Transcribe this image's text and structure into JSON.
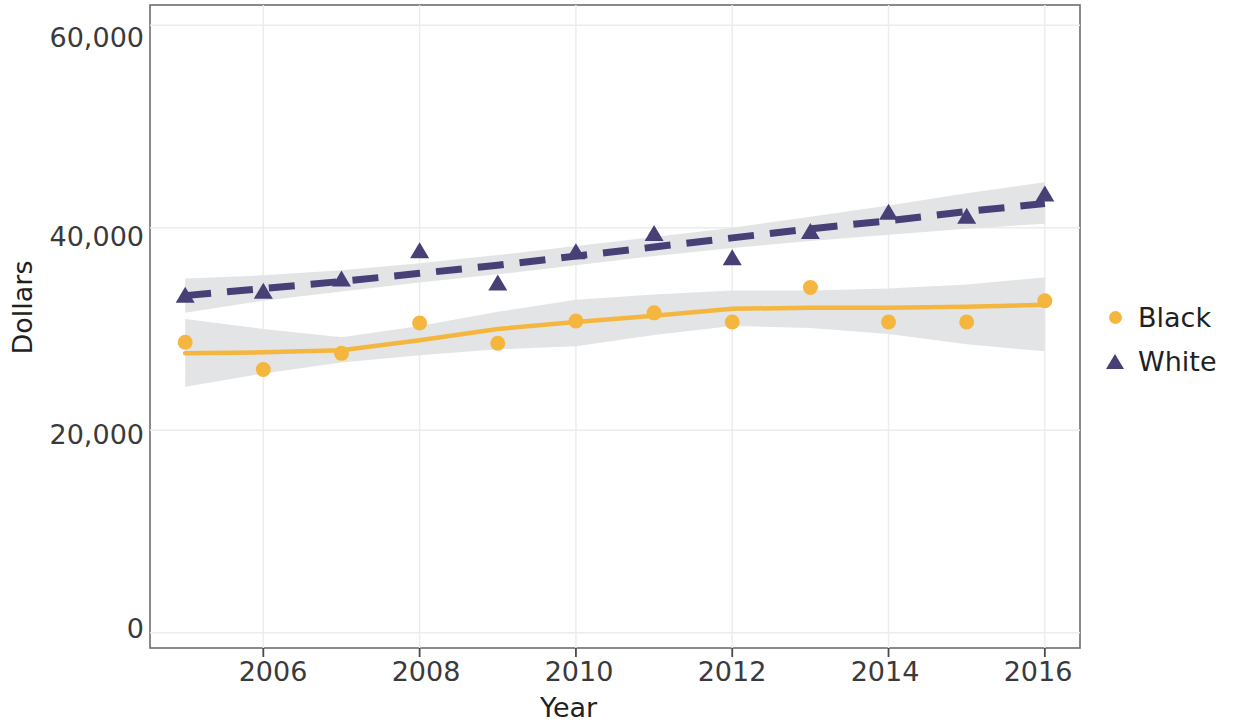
{
  "chart_data": {
    "type": "scatter",
    "title": "",
    "xlabel": "Year",
    "ylabel": "Dollars",
    "xlim": [
      2004.55,
      2016.45
    ],
    "ylim": [
      -1500,
      62000
    ],
    "xticks": [
      2006,
      2008,
      2010,
      2012,
      2014,
      2016
    ],
    "xtick_labels": [
      "2006",
      "2008",
      "2010",
      "2012",
      "2014",
      "2016"
    ],
    "yticks": [
      0,
      20000,
      40000,
      60000
    ],
    "ytick_labels": [
      "0",
      "20,000",
      "40,000",
      "60,000"
    ],
    "grid": true,
    "legend_position": "right",
    "x": [
      2005,
      2006,
      2007,
      2008,
      2009,
      2010,
      2011,
      2012,
      2013,
      2014,
      2015,
      2016
    ],
    "series": [
      {
        "name": "Black",
        "color": "#f5b63f",
        "marker": "circle",
        "line_style": "solid",
        "values": [
          28700,
          26000,
          27600,
          30600,
          28600,
          30800,
          31600,
          30700,
          34100,
          30700,
          30700,
          32800
        ],
        "trend": [
          27600,
          27700,
          27900,
          28900,
          30000,
          30700,
          31300,
          32000,
          32100,
          32100,
          32200,
          32400
        ],
        "band_lower": [
          24300,
          25600,
          26700,
          27400,
          28000,
          28300,
          29400,
          30300,
          30100,
          29500,
          28500,
          27800
        ],
        "band_upper": [
          31000,
          30000,
          29200,
          30300,
          31700,
          32900,
          33400,
          33800,
          33800,
          34000,
          34400,
          35100
        ]
      },
      {
        "name": "White",
        "color": "#464076",
        "marker": "triangle",
        "line_style": "dashed",
        "values": [
          33200,
          33600,
          34800,
          37600,
          34400,
          37500,
          39300,
          36900,
          39500,
          41400,
          41000,
          43200
        ],
        "trend": [
          33300,
          34000,
          34700,
          35500,
          36300,
          37200,
          38100,
          39000,
          39900,
          40700,
          41600,
          42400
        ],
        "band_lower": [
          31600,
          32800,
          33700,
          34600,
          35400,
          36300,
          37200,
          38000,
          38700,
          39300,
          39900,
          40400
        ],
        "band_upper": [
          35000,
          35300,
          35800,
          36500,
          37300,
          38200,
          39100,
          40000,
          41100,
          42200,
          43400,
          44500
        ]
      }
    ],
    "band_color": "#dfe2e4"
  },
  "legend": {
    "items": [
      {
        "label": "Black",
        "symbol": "circle-marker",
        "color": "#f5b63f"
      },
      {
        "label": "White",
        "symbol": "triangle-marker",
        "color": "#464076"
      }
    ]
  },
  "axes": {
    "y_title": "Dollars",
    "x_title": "Year"
  }
}
